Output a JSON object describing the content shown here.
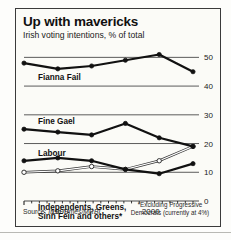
{
  "header": {
    "title": "Up with mavericks",
    "subtitle": "Irish voting intentions, % of total"
  },
  "source": {
    "prefix": "Source: ",
    "name": "Irish Times/MRBI"
  },
  "footnote": "*Excluding Progressive Democrats (currently at 4%)",
  "labels": {
    "fianna_fail": "Fianna Fail",
    "fine_gael": "Fine Gael",
    "labour": "Labour",
    "independents_line1": "Independents, Greens,",
    "independents_line2": "Sinn Fein and others*"
  },
  "colors": {
    "frame": "#3b3b3b",
    "background": "#fbfbf7",
    "line_dark": "#111111",
    "line_open_stroke": "#333333",
    "line_open_fill": "#ffffff",
    "gridline": "#4a4a4a"
  },
  "chart_data": {
    "type": "line",
    "title": "Up with mavericks",
    "subtitle": "Irish voting intentions, % of total",
    "xlabel": "",
    "ylabel": "% of total",
    "ylim": [
      0,
      55
    ],
    "yticks": [
      0,
      10,
      20,
      30,
      40,
      50
    ],
    "ytick_labels": [
      "0",
      "10",
      "20",
      "30",
      "40",
      "50"
    ],
    "grid": true,
    "legend": "inline-labels",
    "x": [
      0,
      1,
      2,
      3,
      4,
      5
    ],
    "xtick_labels": [
      "1999",
      "2000"
    ],
    "xtick_positions": [
      1.05,
      3.75
    ],
    "x_minor_ticks": 22,
    "series": [
      {
        "name": "Fianna Fail",
        "marker": "filled",
        "values": [
          48,
          46,
          47,
          49,
          51,
          45
        ]
      },
      {
        "name": "Fine Gael",
        "marker": "filled",
        "values": [
          25,
          24,
          23,
          27,
          22,
          19
        ]
      },
      {
        "name": "Labour",
        "marker": "filled",
        "values": [
          14,
          15,
          14,
          11,
          9.5,
          13
        ]
      },
      {
        "name": "Independents, Greens, Sinn Fein and others*",
        "marker": "open",
        "values": [
          10,
          10.5,
          12,
          11,
          14,
          19
        ]
      }
    ]
  }
}
